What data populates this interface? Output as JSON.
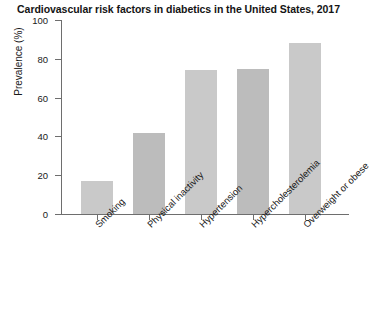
{
  "chart_data": {
    "type": "bar",
    "title": "Cardiovascular risk factors in diabetics in the United States, 2017",
    "xlabel": "",
    "ylabel": "Prevalence (%)",
    "categories": [
      "Smoking",
      "Physical inactivity",
      "Hypertension",
      "Hypercholesterolemia",
      "Overweight or obese"
    ],
    "values": [
      17,
      42,
      74,
      75,
      88
    ],
    "ylim": [
      0,
      100
    ],
    "yticks": [
      0,
      20,
      40,
      60,
      80,
      100
    ],
    "ytick_labels": [
      "0",
      "20",
      "40",
      "60",
      "80",
      "100"
    ],
    "grid": false,
    "legend": null,
    "bar_colors": [
      "#c9c9c9",
      "#bcbcbc",
      "#c9c9c9",
      "#bcbcbc",
      "#c9c9c9"
    ],
    "axis_color": "#6e6e6e"
  }
}
